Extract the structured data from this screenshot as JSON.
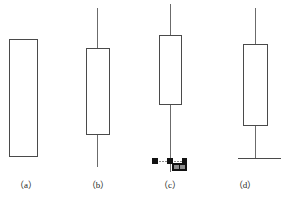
{
  "figure": {
    "title": "",
    "background": "#ffffff",
    "stroke_color": "#3a3a3a",
    "marker_color": "#1a1a1a"
  },
  "panels": [
    {
      "id": "a",
      "caption": "（a）",
      "has_upper_wick": false,
      "has_lower_wick": false,
      "has_baseline": false,
      "has_selection_handles": false,
      "body": {
        "x": 9,
        "y": 39,
        "width": 28,
        "height": 117
      }
    },
    {
      "id": "b",
      "caption": "（b）",
      "has_upper_wick": true,
      "has_lower_wick": true,
      "has_baseline": false,
      "has_selection_handles": false,
      "body": {
        "x": 86,
        "y": 48,
        "width": 23,
        "height": 86
      },
      "wick": {
        "x": 97,
        "top": 8,
        "bottom": 167
      }
    },
    {
      "id": "c",
      "caption": "（c）",
      "has_upper_wick": true,
      "has_lower_wick": true,
      "has_baseline": false,
      "has_selection_handles": true,
      "body": {
        "x": 159,
        "y": 35,
        "width": 22,
        "height": 69
      },
      "wick": {
        "x": 170,
        "top": 4,
        "bottom": 172
      },
      "handles": [
        {
          "x": 152,
          "y": 158,
          "size": 6
        },
        {
          "x": 167,
          "y": 158,
          "size": 6
        },
        {
          "x": 182,
          "y": 158,
          "size": 6
        }
      ],
      "handle_rail": {
        "x1": 152,
        "x2": 185,
        "y": 161
      },
      "badge": {
        "x": 172,
        "y": 163,
        "width": 15,
        "height": 8,
        "label": ""
      }
    },
    {
      "id": "d",
      "caption": "（d）",
      "has_upper_wick": true,
      "has_lower_wick": true,
      "has_baseline": true,
      "has_selection_handles": false,
      "body": {
        "x": 243,
        "y": 44,
        "width": 24,
        "height": 81
      },
      "wick": {
        "x": 255,
        "top": 8,
        "bottom": 158
      },
      "baseline": {
        "x1": 238,
        "x2": 281,
        "y": 158
      }
    }
  ],
  "captions": {
    "a": "（a）",
    "b": "（b）",
    "c": "（c）",
    "d": "（d）"
  }
}
